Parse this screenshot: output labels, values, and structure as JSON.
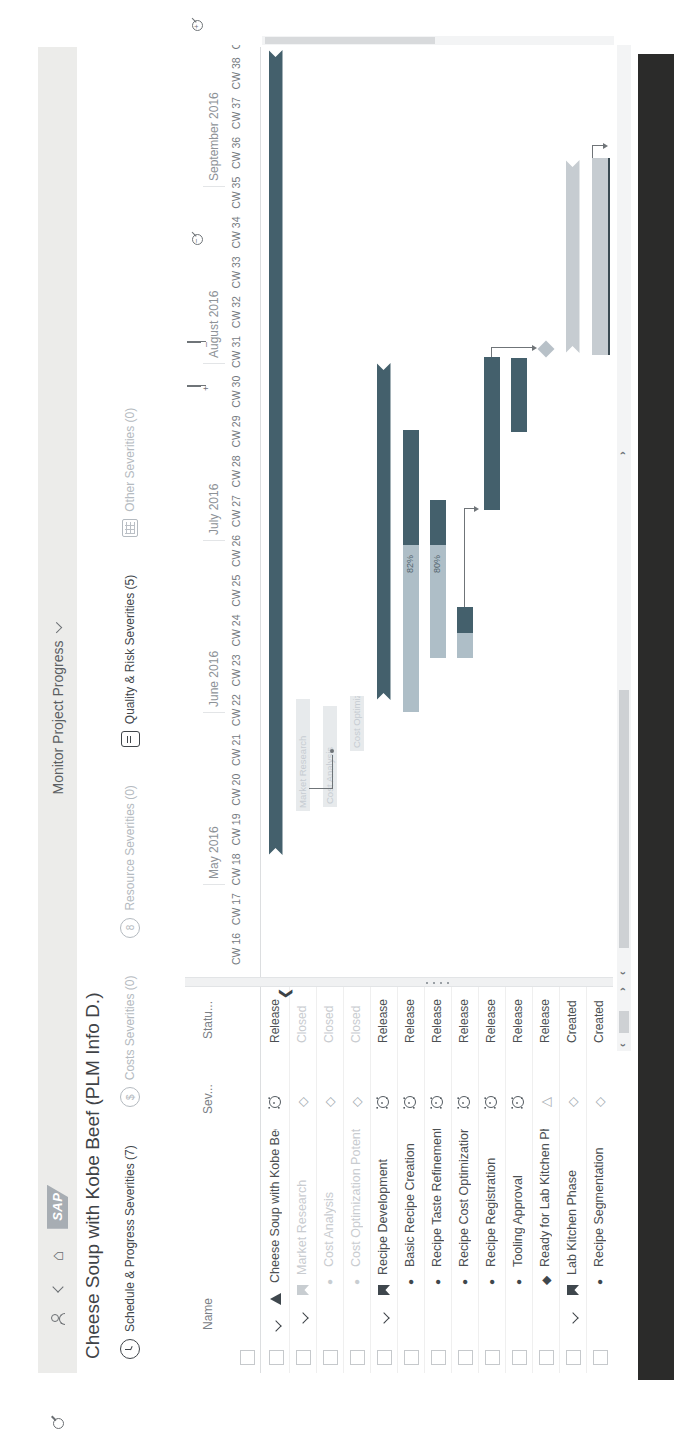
{
  "shell": {
    "logo": "SAP",
    "title": "Monitor Project Progress",
    "icons": [
      "me-icon",
      "back-icon",
      "home-icon",
      "search-icon"
    ]
  },
  "page": {
    "title": "Cheese Soup with Kobe Beef (PLM Info D.)"
  },
  "kpis": [
    {
      "label": "Schedule & Progress Severities (7)",
      "icon": "clock",
      "active": true
    },
    {
      "label": "Costs Severities (0)",
      "icon": "dollar",
      "active": false
    },
    {
      "label": "Resource Severities (0)",
      "icon": "person",
      "active": false
    },
    {
      "label": "Quality & Risk Severities (5)",
      "icon": "doc",
      "active": true
    },
    {
      "label": "Other Severities (0)",
      "icon": "grid",
      "active": false
    }
  ],
  "table": {
    "headers": {
      "name": "Name",
      "severity": "Sev...",
      "status": "Statu..."
    },
    "rows": [
      {
        "name": "Cheese Soup with Kobe Beef (PLM Info D.)",
        "level": 0,
        "icon": "tri",
        "shade": "dark",
        "expander": true,
        "sev": "alert",
        "status": "Released",
        "dim": false
      },
      {
        "name": "Market Research",
        "level": 1,
        "icon": "flag",
        "shade": "light",
        "expander": true,
        "sev": "diamond",
        "status": "Closed",
        "dim": true
      },
      {
        "name": "Cost Analysis",
        "level": 2,
        "icon": "circ",
        "shade": "light",
        "expander": false,
        "sev": "diamond",
        "status": "Closed",
        "dim": true
      },
      {
        "name": "Cost Optimization Potential",
        "level": 2,
        "icon": "circ",
        "shade": "light",
        "expander": false,
        "sev": "diamond",
        "status": "Closed",
        "dim": true
      },
      {
        "name": "Recipe Development",
        "level": 1,
        "icon": "flag",
        "shade": "dark",
        "expander": true,
        "sev": "alert",
        "status": "Released",
        "dim": false
      },
      {
        "name": "Basic Recipe Creation",
        "level": 2,
        "icon": "circ",
        "shade": "dark",
        "expander": false,
        "sev": "alert",
        "status": "Released",
        "dim": false
      },
      {
        "name": "Recipe Taste Refinement",
        "level": 2,
        "icon": "circ",
        "shade": "dark",
        "expander": false,
        "sev": "alert",
        "status": "Released",
        "dim": false
      },
      {
        "name": "Recipe Cost Optimization",
        "level": 2,
        "icon": "circ",
        "shade": "dark",
        "expander": false,
        "sev": "alert",
        "status": "Released",
        "dim": false
      },
      {
        "name": "Recipe Registration",
        "level": 2,
        "icon": "circ",
        "shade": "dark",
        "expander": false,
        "sev": "alert",
        "status": "Released",
        "dim": false
      },
      {
        "name": "Tooling Approval",
        "level": 2,
        "icon": "circ",
        "shade": "dark",
        "expander": false,
        "sev": "alert",
        "status": "Released",
        "dim": false
      },
      {
        "name": "Ready for Lab Kitchen Phase",
        "level": 2,
        "icon": "diam",
        "shade": "dark",
        "expander": false,
        "sev": "triangle",
        "status": "Released",
        "dim": false
      },
      {
        "name": "Lab Kitchen Phase",
        "level": 1,
        "icon": "flag",
        "shade": "dark",
        "expander": true,
        "sev": "diamond",
        "status": "Created",
        "dim": false
      },
      {
        "name": "Recipe Segmentation",
        "level": 2,
        "icon": "circ",
        "shade": "dark",
        "expander": false,
        "sev": "diamond",
        "status": "Created",
        "dim": false
      }
    ]
  },
  "gantt": {
    "months": [
      {
        "label": "May 2016",
        "x": 94
      },
      {
        "label": "June 2016",
        "x": 266
      },
      {
        "label": "July 2016",
        "x": 438
      },
      {
        "label": "August 2016",
        "x": 615
      },
      {
        "label": "September 2016",
        "x": 792
      }
    ],
    "weeks": {
      "first": 16,
      "count": 24,
      "prefix": "CW",
      "x0": 14,
      "step": 39.8
    },
    "bars": [
      {
        "row": 1,
        "type": "summary",
        "x1": 124,
        "x2": 929
      },
      {
        "row": 2,
        "type": "faint",
        "x1": 168,
        "x2": 277,
        "label": "Market Research"
      },
      {
        "row": 3,
        "type": "faint",
        "x1": 172,
        "x2": 270,
        "label": "Cost Analysis"
      },
      {
        "row": 4,
        "type": "faint",
        "x1": 228,
        "x2": 280,
        "label": "Cost Optimization Pot"
      },
      {
        "row": 5,
        "type": "summary",
        "x1": 279,
        "x2": 616
      },
      {
        "row": 6,
        "type": "task",
        "x1": 267,
        "x2": 549,
        "split": 434,
        "label": "82%"
      },
      {
        "row": 7,
        "type": "task",
        "x1": 321,
        "x2": 479,
        "split": 434,
        "label": "80%"
      },
      {
        "row": 8,
        "type": "task",
        "x1": 321,
        "x2": 372,
        "split": 346
      },
      {
        "row": 9,
        "type": "taskdark",
        "x1": 469,
        "x2": 622
      },
      {
        "row": 10,
        "type": "taskdark",
        "x1": 547,
        "x2": 621
      },
      {
        "row": 11,
        "type": "milestone",
        "cx": 630
      },
      {
        "row": 12,
        "type": "summarylight",
        "x1": 626,
        "x2": 819
      },
      {
        "row": 13,
        "type": "tasklight",
        "x1": 624,
        "x2": 821,
        "darkBottom": true
      }
    ],
    "connectors": [
      {
        "segs": [
          [
            190,
            47,
            190,
            70
          ],
          [
            190,
            70,
            224,
            70
          ]
        ],
        "dot": [
          226,
          70
        ]
      },
      {
        "segs": [
          [
            372,
            202,
            470,
            202
          ],
          [
            470,
            202,
            470,
            212
          ]
        ],
        "arrow": [
          470,
          212
        ]
      },
      {
        "segs": [
          [
            622,
            229,
            631,
            229
          ],
          [
            631,
            229,
            631,
            270
          ]
        ],
        "arrow": [
          631,
          270
        ]
      },
      {
        "segs": [
          [
            821,
            330,
            833,
            330
          ],
          [
            833,
            330,
            833,
            341
          ]
        ],
        "arrow": [
          833,
          341
        ]
      }
    ]
  },
  "colors": {
    "bar_dark": "#44606c",
    "bar_light": "#aebec7",
    "bar_grey": "#c6ccd1",
    "bar_faint": "#e7eaec",
    "milestone": "#b8c1c8",
    "shell_bg": "#ececea",
    "footer_bar": "#2b2b2a"
  }
}
